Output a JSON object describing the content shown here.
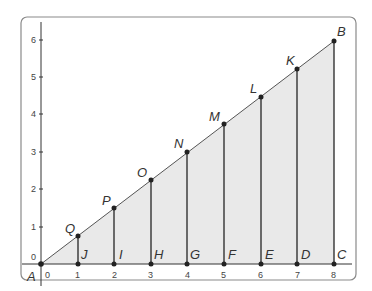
{
  "diagram": {
    "type": "similar-triangles-on-grid",
    "frame": {
      "border_color": "#8a8a8a",
      "fill": "#ffffff"
    },
    "shade_color": "#e6e6e6",
    "line_color": "#333333",
    "axes": {
      "x_ticks": [
        "0",
        "1",
        "2",
        "3",
        "4",
        "5",
        "6",
        "7",
        "8"
      ],
      "y_ticks": [
        "0",
        "1",
        "2",
        "3",
        "4",
        "5",
        "6"
      ]
    },
    "hypotenuse": {
      "from": "A",
      "to": "B",
      "slope": 0.75
    },
    "points": {
      "A": {
        "label": "A",
        "x": 0,
        "y": 0
      },
      "B": {
        "label": "B",
        "x": 8,
        "y": 6
      },
      "C": {
        "label": "C",
        "x": 8,
        "y": 0
      },
      "D": {
        "label": "D",
        "x": 7,
        "y": 0
      },
      "E": {
        "label": "E",
        "x": 6,
        "y": 0
      },
      "F": {
        "label": "F",
        "x": 5,
        "y": 0
      },
      "G": {
        "label": "G",
        "x": 4,
        "y": 0
      },
      "H": {
        "label": "H",
        "x": 3,
        "y": 0
      },
      "I": {
        "label": "I",
        "x": 2,
        "y": 0
      },
      "J": {
        "label": "J",
        "x": 1,
        "y": 0
      },
      "K": {
        "label": "K",
        "x": 7,
        "y": 5.25
      },
      "L": {
        "label": "L",
        "x": 6,
        "y": 4.5
      },
      "M": {
        "label": "M",
        "x": 5,
        "y": 3.75
      },
      "N": {
        "label": "N",
        "x": 4,
        "y": 3
      },
      "O": {
        "label": "O",
        "x": 3,
        "y": 2.25
      },
      "P": {
        "label": "P",
        "x": 2,
        "y": 1.5
      },
      "Q": {
        "label": "Q",
        "x": 1,
        "y": 0.75
      }
    },
    "segments": [
      [
        "Q",
        "J"
      ],
      [
        "P",
        "I"
      ],
      [
        "O",
        "H"
      ],
      [
        "N",
        "G"
      ],
      [
        "M",
        "F"
      ],
      [
        "L",
        "E"
      ],
      [
        "K",
        "D"
      ],
      [
        "B",
        "C"
      ]
    ]
  }
}
